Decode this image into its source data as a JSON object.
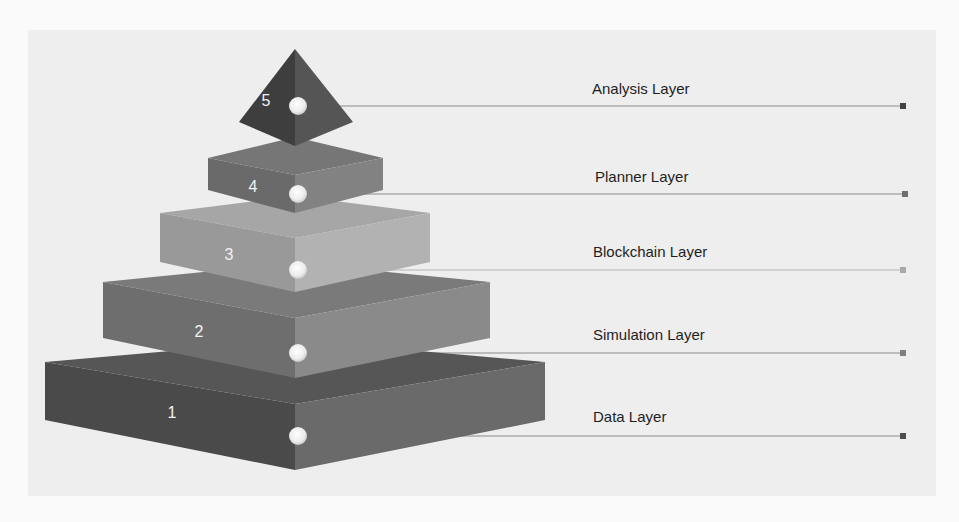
{
  "diagram": {
    "type": "layered-pyramid",
    "layers": [
      {
        "number": "5",
        "label": "Analysis Layer",
        "marker_color": "#444444"
      },
      {
        "number": "4",
        "label": "Planner Layer",
        "marker_color": "#6f6f6f"
      },
      {
        "number": "3",
        "label": "Blockchain Layer",
        "marker_color": "#a9a9a9"
      },
      {
        "number": "2",
        "label": "Simulation Layer",
        "marker_color": "#808080"
      },
      {
        "number": "1",
        "label": "Data Layer",
        "marker_color": "#4d4d4d"
      }
    ]
  },
  "colors": {
    "background": "#fafafa",
    "panel": "#eeeeee",
    "layer1_left": "#4a4a4a",
    "layer1_right": "#6a6a6a",
    "layer1_top": "#565656",
    "layer2_left": "#6e6e6e",
    "layer2_right": "#8a8a8a",
    "layer2_top": "#7a7a7a",
    "layer3_left": "#999999",
    "layer3_right": "#b2b2b2",
    "layer3_top": "#a6a6a6",
    "layer4_left": "#6a6a6a",
    "layer4_right": "#828282",
    "layer4_top": "#767676",
    "layer5_left": "#3e3e3e",
    "layer5_right": "#555555"
  }
}
